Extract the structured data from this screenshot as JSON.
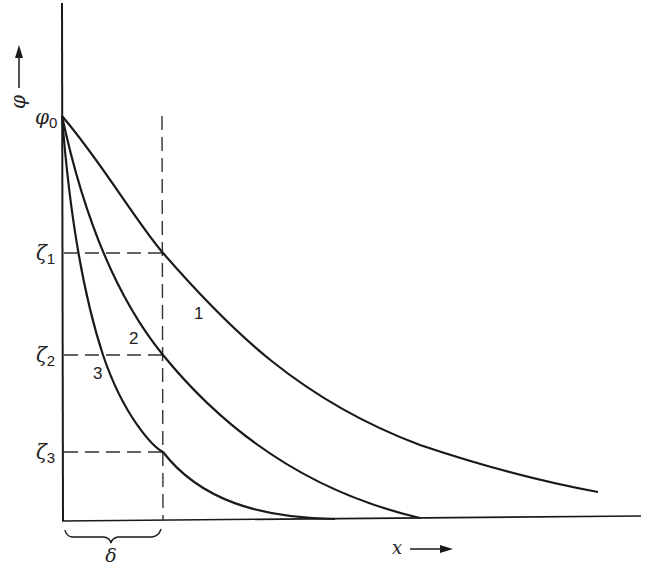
{
  "diagram": {
    "y_axis_label": "φ",
    "x_axis_label": "x",
    "origin_value_label": "φ",
    "origin_value_subscript": "0",
    "levels": [
      {
        "symbol": "ζ",
        "subscript": "1"
      },
      {
        "symbol": "ζ",
        "subscript": "2"
      },
      {
        "symbol": "ζ",
        "subscript": "3"
      }
    ],
    "curves": [
      {
        "label": "1"
      },
      {
        "label": "2"
      },
      {
        "label": "3"
      }
    ],
    "width_label": "δ",
    "colors": {
      "line": "#1a1a1a",
      "dash": "#333333",
      "background": "#ffffff"
    }
  }
}
